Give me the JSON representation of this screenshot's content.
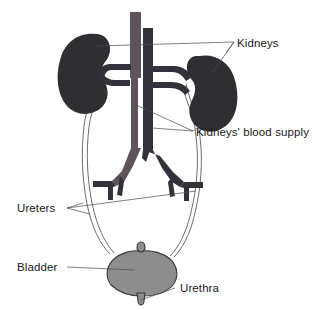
{
  "figure": {
    "background_color": "#ffffff"
  },
  "colors": {
    "kidney": "#2f2e33",
    "aorta": "#5d545c",
    "vena_cava": "#33313a",
    "bladder": "#8d8d8d",
    "outline": "#3a3a3a",
    "leader_line": "#4a4a4a",
    "text": "#1a1a1a"
  },
  "labels": {
    "kidneys": "Kidneys",
    "blood_supply": "Kidneys' blood supply",
    "ureters": "Ureters",
    "bladder": "Bladder",
    "urethra": "Urethra"
  },
  "structures": [
    {
      "name": "left-kidney",
      "label": "Kidneys",
      "color": "#2f2e33"
    },
    {
      "name": "right-kidney",
      "label": "Kidneys",
      "color": "#2f2e33"
    },
    {
      "name": "renal-vessels",
      "label": "Kidneys' blood supply",
      "color": "#5d545c"
    },
    {
      "name": "left-ureter",
      "label": "Ureters",
      "color": "#3d3d3d"
    },
    {
      "name": "right-ureter",
      "label": "Ureters",
      "color": "#3d3d3d"
    },
    {
      "name": "bladder",
      "label": "Bladder",
      "color": "#8d8d8d"
    },
    {
      "name": "urethra",
      "label": "Urethra",
      "color": "#8d8d8d"
    }
  ]
}
